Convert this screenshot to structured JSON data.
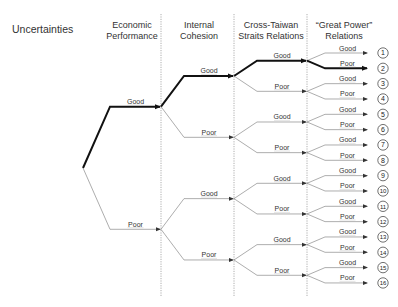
{
  "title": "Uncertainties",
  "columns": [
    {
      "line1": "Economic",
      "line2": "Performance"
    },
    {
      "line1": "Internal",
      "line2": "Cohesion"
    },
    {
      "line1": "Cross-Taiwan",
      "line2": "Straits Relations"
    },
    {
      "line1": "“Great Power”",
      "line2": "Relations"
    }
  ],
  "branch_labels": {
    "good": "Good",
    "poor": "Poor"
  },
  "highlighted_path": [
    "Good",
    "Good",
    "Good",
    "Poor"
  ],
  "highlighted_outcome": 2,
  "outcomes": [
    {
      "id": 1,
      "path": [
        "Good",
        "Good",
        "Good",
        "Good"
      ]
    },
    {
      "id": 2,
      "path": [
        "Good",
        "Good",
        "Good",
        "Poor"
      ]
    },
    {
      "id": 3,
      "path": [
        "Good",
        "Good",
        "Poor",
        "Good"
      ]
    },
    {
      "id": 4,
      "path": [
        "Good",
        "Good",
        "Poor",
        "Poor"
      ]
    },
    {
      "id": 5,
      "path": [
        "Good",
        "Poor",
        "Good",
        "Good"
      ]
    },
    {
      "id": 6,
      "path": [
        "Good",
        "Poor",
        "Good",
        "Poor"
      ]
    },
    {
      "id": 7,
      "path": [
        "Good",
        "Poor",
        "Poor",
        "Good"
      ]
    },
    {
      "id": 8,
      "path": [
        "Good",
        "Poor",
        "Poor",
        "Poor"
      ]
    },
    {
      "id": 9,
      "path": [
        "Poor",
        "Good",
        "Good",
        "Good"
      ]
    },
    {
      "id": 10,
      "path": [
        "Poor",
        "Good",
        "Good",
        "Poor"
      ]
    },
    {
      "id": 11,
      "path": [
        "Poor",
        "Good",
        "Poor",
        "Good"
      ]
    },
    {
      "id": 12,
      "path": [
        "Poor",
        "Good",
        "Poor",
        "Poor"
      ]
    },
    {
      "id": 13,
      "path": [
        "Poor",
        "Poor",
        "Good",
        "Good"
      ]
    },
    {
      "id": 14,
      "path": [
        "Poor",
        "Poor",
        "Good",
        "Poor"
      ]
    },
    {
      "id": 15,
      "path": [
        "Poor",
        "Poor",
        "Poor",
        "Good"
      ]
    },
    {
      "id": 16,
      "path": [
        "Poor",
        "Poor",
        "Poor",
        "Poor"
      ]
    }
  ],
  "colors": {
    "line": "#8a8a8a",
    "highlight": "#111111",
    "text": "#333333",
    "divider": "#9a9a9a"
  }
}
